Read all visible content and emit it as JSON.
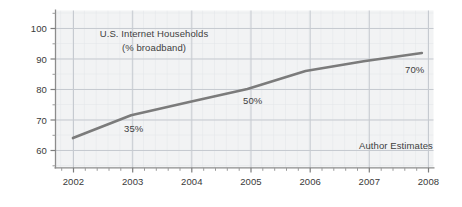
{
  "chart_data": {
    "type": "line",
    "title": "U.S. Internet Households",
    "subtitle": "(% broadband)",
    "xlabel": "",
    "ylabel": "",
    "x": [
      2002,
      2003,
      2004,
      2005,
      2006,
      2007,
      2008
    ],
    "values": [
      65,
      72,
      76,
      80,
      85.5,
      88.5,
      91
    ],
    "series": [
      {
        "name": "U.S. Internet Households (% broadband)",
        "values": [
          65,
          72,
          76,
          80,
          85.5,
          88.5,
          91
        ]
      }
    ],
    "xlim": [
      2001.7,
      2008.2
    ],
    "ylim": [
      56,
      104
    ],
    "x_tick_labels": [
      "2002",
      "2003",
      "2004",
      "2005",
      "2006",
      "2007",
      "2008"
    ],
    "y_tick_labels": [
      "60",
      "70",
      "80",
      "90",
      "100"
    ],
    "y_ticks": [
      60,
      70,
      80,
      90,
      100
    ],
    "grid": true,
    "minor_grid": true,
    "legend": "none",
    "line_color": "#7b7b7b",
    "grid_color": "#c9cdd4",
    "minor_grid_color": "#e3e5e9",
    "plot_background": "#f2f3f4",
    "frame_color": "#8c8c8c",
    "annotations": [
      {
        "text": "35%",
        "x": 2003.0,
        "y": 67.5
      },
      {
        "text": "50%",
        "x": 2004.95,
        "y": 76.5
      },
      {
        "text": "70%",
        "x": 2007.6,
        "y": 88.0
      },
      {
        "text": "Author Estimates",
        "x": 2007.05,
        "y": 63.5
      }
    ]
  },
  "chart": {
    "title_line1": "U.S. Internet Households",
    "title_line2": "(% broadband)",
    "source_note": "Author Estimates",
    "label_35": "35%",
    "label_50": "50%",
    "label_70": "70%",
    "ytick_100": "100",
    "ytick_90": "90",
    "ytick_80": "80",
    "ytick_70": "70",
    "ytick_60": "60",
    "xtick_2002": "2002",
    "xtick_2003": "2003",
    "xtick_2004": "2004",
    "xtick_2005": "2005",
    "xtick_2006": "2006",
    "xtick_2007": "2007",
    "xtick_2008": "2008"
  }
}
